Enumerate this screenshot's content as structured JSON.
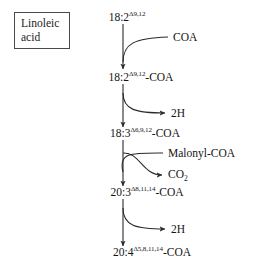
{
  "figure": {
    "kind": "biochemical-pathway-diagram",
    "background_color": "#ffffff",
    "stroke_color": "#2b2b2b",
    "text_color": "#141414"
  },
  "tag": {
    "name": "linoleic-acid-tag",
    "line1": "Linoleic",
    "line2": "acid",
    "border_color": "#4a4a4a"
  },
  "nodes": [
    {
      "id": "node-1",
      "base": "18:2",
      "superscript": "Δ9,12",
      "suffix": ""
    },
    {
      "id": "node-2",
      "base": "18:2",
      "superscript": "Δ9,12",
      "suffix": "-COA"
    },
    {
      "id": "node-3",
      "base": "18:3",
      "superscript": "Δ6,9,12",
      "suffix": "-COA"
    },
    {
      "id": "node-4",
      "base": "20:3",
      "superscript": "Δ8,11,14",
      "suffix": "-COA"
    },
    {
      "id": "node-5",
      "base": "20:4",
      "superscript": "Δ5,8,11,14",
      "suffix": "-COA"
    }
  ],
  "side_labels": [
    {
      "id": "side-coa",
      "text": "COA",
      "direction": "input"
    },
    {
      "id": "side-2h-1",
      "base": "2H",
      "sub": "",
      "text": "2H",
      "direction": "output"
    },
    {
      "id": "side-malonyl-coa",
      "text": "Malonyl-COA",
      "direction": "input"
    },
    {
      "id": "side-co2",
      "base": "CO",
      "sub": "2",
      "text": "CO2",
      "direction": "output"
    },
    {
      "id": "side-2h-2",
      "base": "2H",
      "sub": "",
      "text": "2H",
      "direction": "output"
    }
  ],
  "steps": [
    {
      "id": "step-1",
      "from": "node-1",
      "to": "node-2",
      "adds": "COA",
      "removes": ""
    },
    {
      "id": "step-2",
      "from": "node-2",
      "to": "node-3",
      "adds": "",
      "removes": "2H"
    },
    {
      "id": "step-3",
      "from": "node-3",
      "to": "node-4",
      "adds": "Malonyl-COA",
      "removes": "CO2"
    },
    {
      "id": "step-4",
      "from": "node-4",
      "to": "node-5",
      "adds": "",
      "removes": "2H"
    }
  ]
}
